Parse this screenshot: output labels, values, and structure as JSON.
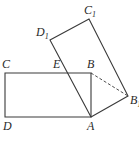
{
  "diagram": {
    "type": "geometry",
    "line_color": "#3a3a3a",
    "points": {
      "A": {
        "x": 91,
        "y": 117,
        "label": "A",
        "label_x": 87,
        "label_y": 130
      },
      "B": {
        "x": 91,
        "y": 73,
        "label": "B",
        "label_x": 87,
        "label_y": 68
      },
      "C": {
        "x": 5,
        "y": 73,
        "label": "C",
        "label_x": 2,
        "label_y": 68
      },
      "D": {
        "x": 5,
        "y": 117,
        "label": "D",
        "label_x": 3,
        "label_y": 130
      },
      "E": {
        "x": 66,
        "y": 73,
        "label": "E",
        "label_x": 53,
        "label_y": 68
      },
      "B1": {
        "x": 128,
        "y": 96,
        "label": "B",
        "sub": "1",
        "label_x": 130,
        "label_y": 104
      },
      "C1": {
        "x": 89,
        "y": 19,
        "label": "C",
        "sub": "1",
        "label_x": 84,
        "label_y": 14
      },
      "D1": {
        "x": 50,
        "y": 40,
        "label": "D",
        "sub": "1",
        "label_x": 36,
        "label_y": 36
      }
    },
    "segments": [
      {
        "from": "A",
        "to": "B",
        "style": "solid"
      },
      {
        "from": "B",
        "to": "C",
        "style": "solid"
      },
      {
        "from": "C",
        "to": "D",
        "style": "solid"
      },
      {
        "from": "D",
        "to": "A",
        "style": "solid"
      },
      {
        "from": "A",
        "to": "B1",
        "style": "solid"
      },
      {
        "from": "B1",
        "to": "C1",
        "style": "solid"
      },
      {
        "from": "C1",
        "to": "D1",
        "style": "solid"
      },
      {
        "from": "D1",
        "to": "A",
        "style": "solid"
      },
      {
        "from": "B",
        "to": "B1",
        "style": "dashed"
      }
    ]
  }
}
